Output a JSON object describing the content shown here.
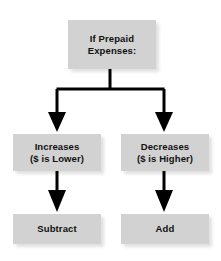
{
  "diagram": {
    "type": "flowchart",
    "colors": {
      "node_fill": "#d2d2d2",
      "node_text": "#111111",
      "connector": "#000000",
      "background": "#ffffff"
    },
    "nodes": [
      {
        "id": "root",
        "label": "If Prepaid\nExpenses:",
        "role": "condition"
      },
      {
        "id": "increases",
        "label": "Increases\n($ is Lower)",
        "role": "branch"
      },
      {
        "id": "decreases",
        "label": "Decreases\n($ is Higher)",
        "role": "branch"
      },
      {
        "id": "subtract",
        "label": "Subtract",
        "role": "action"
      },
      {
        "id": "add",
        "label": "Add",
        "role": "action"
      }
    ],
    "edges": [
      {
        "from": "root",
        "to": "increases",
        "style": "arrow"
      },
      {
        "from": "root",
        "to": "decreases",
        "style": "arrow"
      },
      {
        "from": "increases",
        "to": "subtract",
        "style": "arrow"
      },
      {
        "from": "decreases",
        "to": "add",
        "style": "arrow"
      }
    ]
  }
}
